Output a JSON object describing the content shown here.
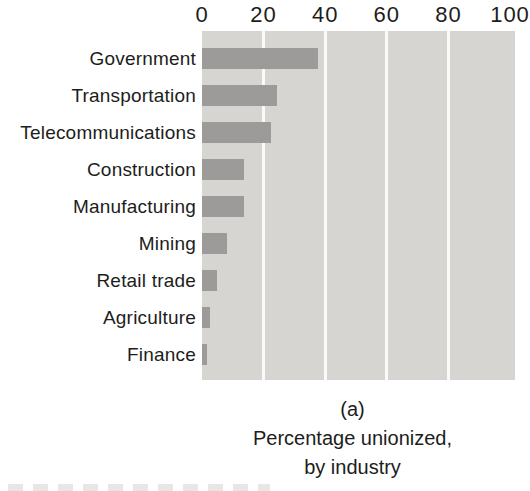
{
  "colors": {
    "background": "#ffffff",
    "plot_background": "#d6d5d2",
    "bar": "#9c9b99",
    "gridline": "#fbfaf8",
    "text": "#1d1d1b"
  },
  "chart_data": {
    "type": "bar",
    "orientation": "horizontal",
    "title": "Percentage unionized, by industry",
    "panel_label": "(a)",
    "categories": [
      "Government",
      "Transportation",
      "Telecommunications",
      "Construction",
      "Manufacturing",
      "Mining",
      "Retail trade",
      "Agriculture",
      "Finance"
    ],
    "values": [
      37.5,
      24.5,
      22.5,
      13.5,
      13.5,
      8,
      5,
      2.5,
      1.5
    ],
    "x_ticks": [
      0,
      20,
      40,
      60,
      80,
      100
    ],
    "gridlines": [
      20,
      40,
      60,
      80
    ],
    "xlim": [
      0,
      100
    ],
    "axis_position": "top",
    "grid": true,
    "legend": false,
    "xlabel": "",
    "ylabel": ""
  },
  "caption": {
    "panel_label": "(a)",
    "line1": "Percentage unionized,",
    "line2": "by industry"
  }
}
